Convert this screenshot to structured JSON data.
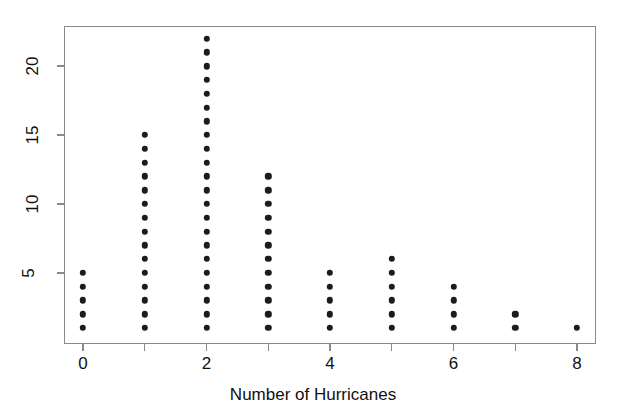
{
  "chart_data": {
    "type": "scatter",
    "plot_style": "dot-plot",
    "title": "",
    "subtitle": "",
    "xlabel": "Number of Hurricanes",
    "ylabel": "",
    "categories": [
      0,
      1,
      2,
      3,
      4,
      5,
      6,
      7,
      8
    ],
    "values": [
      5,
      15,
      22,
      12,
      5,
      6,
      4,
      2,
      1
    ],
    "series": [
      {
        "name": "Frequency",
        "values": [
          5,
          15,
          22,
          12,
          5,
          6,
          4,
          2,
          1
        ]
      }
    ],
    "total_observations": 72,
    "xlim": [
      -0.3,
      8.3
    ],
    "ylim": [
      0.5,
      22.6
    ],
    "x_ticks": [
      0,
      1,
      2,
      3,
      4,
      5,
      6,
      7,
      8
    ],
    "x_tick_labels": [
      "0",
      "",
      "2",
      "",
      "4",
      "",
      "6",
      "",
      "8"
    ],
    "y_ticks": [
      5,
      10,
      15,
      20
    ],
    "y_tick_labels": [
      "5",
      "10",
      "15",
      "20"
    ],
    "y_tick_label_rotation": -90,
    "grid": false,
    "legend": null,
    "legend_position": "none",
    "annotations": [],
    "marker": {
      "shape": "circle",
      "color": "#1c1c1c",
      "size_px": 6.4
    },
    "frame_color": "#8a8a8a",
    "background_color": "#ffffff"
  },
  "axis": {
    "x_title": "Number of Hurricanes"
  }
}
